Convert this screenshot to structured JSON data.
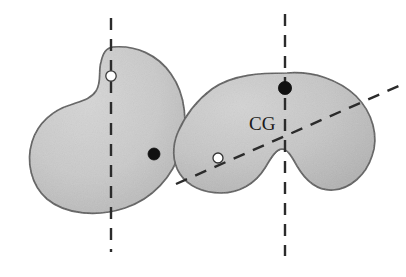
{
  "figure": {
    "title": "",
    "background_color": "#ffffff",
    "width": 406,
    "height": 277,
    "colors": {
      "body_fill": "#c9c9c9",
      "body_fill_dark": "#b8b8b8",
      "outline": "#5a5a5a",
      "dashed_line": "#2b2b2b",
      "marker_filled": "#111111",
      "marker_hollow_fill": "#ffffff",
      "marker_hollow_stroke": "#333333",
      "label_text": "#1a1a1a"
    },
    "objects": [
      {
        "id": "left-body",
        "name": "bean-shaped-body",
        "fill": "#c9c9c9",
        "outline": "#5a5a5a",
        "path": "M 112 48 C 135 46 157 56 170 76 C 184 97 185 126 178 150 C 170 177 150 198 124 207 C 98 216 68 214 50 199 C 33 185 28 163 33 143 C 38 124 53 111 68 106 C 78 102 88 100 93 93 C 99 85 96 75 99 64 C 101 55 105 49 112 48 Z",
        "axis": "left-vertical-axis",
        "markers": [
          "left-hollow-marker",
          "left-filled-marker"
        ]
      },
      {
        "id": "right-body",
        "name": "kidney-shaped-body",
        "fill": "#c9c9c9",
        "outline": "#5a5a5a",
        "path": "M 285 74 C 310 72 332 79 348 93 C 365 108 372 131 368 152 C 364 173 350 187 333 188 C 316 189 305 179 298 168 C 292 158 287 151 281 151 C 274 151 269 159 263 168 C 255 181 242 189 225 190 C 207 191 196 184 196 184 C 196 184 196 184 196 184 C 214 190 209 189 203 187 C 191 183 198 186 197 185 C 196 185 196 185 196 185 C 184 180 197 185 196 185 C 196 185 196 185 196 185 C 196 185 196 185 196 185 L 196 185 C 196 185 196 185 196 185 C 182 181 196 185 196 185 C 196 185 196 185 196 185 C 196 185 196 185 196 185 C 196 185 196 185 196 185 L 196 185 Z",
        "axis": "right-vertical-axis",
        "markers": [
          "right-filled-marker",
          "right-hollow-marker"
        ],
        "label": "CG"
      }
    ],
    "labels": [
      {
        "id": "cg-label",
        "text": "CG",
        "x": 249,
        "y": 129
      }
    ],
    "axes": [
      {
        "id": "left-vertical-axis",
        "name": "left-vertical-dashed-axis",
        "x1": 111,
        "y1": 18,
        "x2": 111,
        "y2": 252,
        "style": "dashed"
      },
      {
        "id": "right-vertical-axis",
        "name": "right-vertical-dashed-axis",
        "x1": 285,
        "y1": 14,
        "x2": 285,
        "y2": 256,
        "style": "dashed"
      },
      {
        "id": "right-diagonal-axis",
        "name": "right-diagonal-dashed-axis",
        "x1": 176,
        "y1": 184,
        "x2": 401,
        "y2": 85,
        "style": "dashed"
      }
    ],
    "markers": [
      {
        "id": "left-hollow-marker",
        "name": "suspension-point-marker",
        "type": "hollow",
        "cx": 111,
        "cy": 76,
        "r": 5.2
      },
      {
        "id": "left-filled-marker",
        "name": "center-of-gravity-marker",
        "type": "filled",
        "cx": 154,
        "cy": 154,
        "r": 6.0
      },
      {
        "id": "right-filled-marker",
        "name": "suspension-point-marker",
        "type": "filled",
        "cx": 285,
        "cy": 88,
        "r": 6.6
      },
      {
        "id": "right-hollow-marker",
        "name": "secondary-point-marker",
        "type": "hollow",
        "cx": 218,
        "cy": 158,
        "r": 5.0
      }
    ]
  }
}
